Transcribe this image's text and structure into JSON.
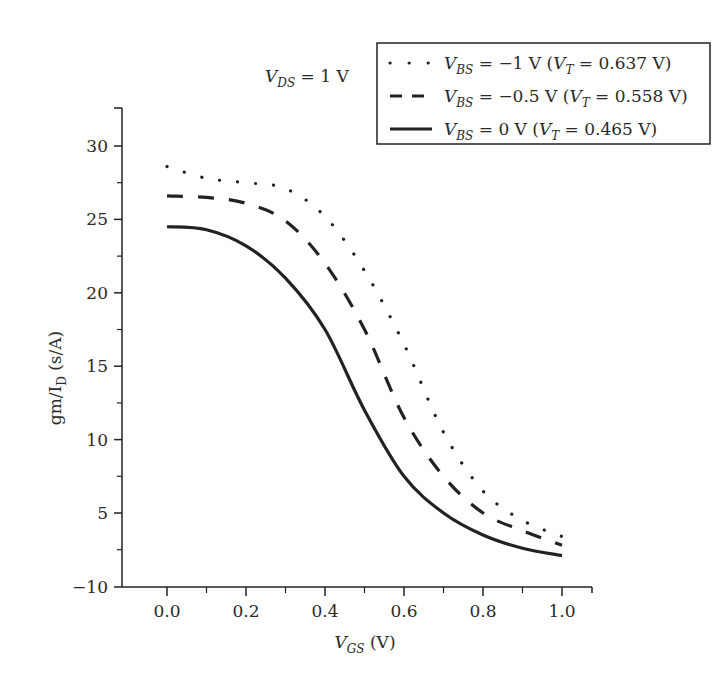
{
  "chart_data": {
    "type": "line",
    "title": "",
    "annotation": {
      "prefix": "V",
      "sub": "DS",
      "suffix": " = 1 V"
    },
    "xlabel": {
      "prefix": "V",
      "sub": "GS",
      "suffix": " (V)"
    },
    "ylabel": {
      "prefix": "gm/I",
      "sub": "D",
      "suffix": " (s/A)"
    },
    "xlim": [
      -0.12,
      1.08
    ],
    "ylim": [
      3.0,
      32.5
    ],
    "x_ticks": [
      0.0,
      0.2,
      0.4,
      0.6,
      0.8,
      1.0
    ],
    "x_tick_labels": [
      "0.0",
      "0.2",
      "0.4",
      "0.6",
      "0.8",
      "1.0"
    ],
    "x_minor_ticks": [
      0.1,
      0.3,
      0.5,
      0.7,
      0.9
    ],
    "y_ticks": [
      30,
      25,
      20,
      15,
      10,
      5
    ],
    "y_tick_labels": [
      "30",
      "25",
      "20",
      "15",
      "10",
      "5"
    ],
    "y_bottom_label": "−10",
    "y_minor_ticks": [
      27.5,
      22.5,
      17.5,
      12.5,
      7.5,
      2.5
    ],
    "grid": false,
    "legend_position": "top-right",
    "x": [
      0.0,
      0.1,
      0.2,
      0.3,
      0.4,
      0.5,
      0.6,
      0.7,
      0.8,
      0.9,
      1.0
    ],
    "series": [
      {
        "name": "V_BS = −1 V (V_T = 0.637 V)",
        "style": "dotted",
        "legend": {
          "vbs": "−1 V",
          "vt": "0.637 V"
        },
        "values": [
          28.6,
          27.8,
          27.5,
          27.1,
          25.2,
          21.5,
          16.5,
          10.5,
          6.5,
          4.5,
          3.4
        ]
      },
      {
        "name": "V_BS = −0.5 V (V_T = 0.558 V)",
        "style": "dashed",
        "legend": {
          "vbs": "−0.5 V",
          "vt": "0.558 V"
        },
        "values": [
          26.6,
          26.5,
          26.1,
          24.9,
          22.0,
          17.5,
          11.5,
          7.5,
          5.0,
          3.8,
          2.8
        ]
      },
      {
        "name": "V_BS = 0 V (V_T = 0.465 V)",
        "style": "solid",
        "legend": {
          "vbs": "0 V",
          "vt": "0.465 V"
        },
        "values": [
          24.5,
          24.3,
          23.2,
          21.0,
          17.5,
          12.0,
          7.5,
          5.0,
          3.5,
          2.6,
          2.1
        ]
      }
    ]
  },
  "colors": {
    "ink": "#222222",
    "background": "#ffffff"
  }
}
